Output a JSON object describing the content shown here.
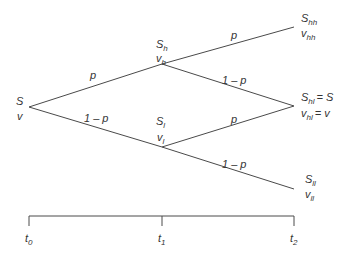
{
  "diagram": {
    "type": "binomial-tree",
    "nodes": [
      {
        "id": "root",
        "price": "S",
        "value": "v"
      },
      {
        "id": "h",
        "price_base": "S",
        "price_sub": "h",
        "value_base": "v",
        "value_sub": "h"
      },
      {
        "id": "l",
        "price_base": "S",
        "price_sub": "l",
        "value_base": "v",
        "value_sub": "l"
      },
      {
        "id": "hh",
        "price_base": "S",
        "price_sub": "hh",
        "value_base": "v",
        "value_sub": "hh"
      },
      {
        "id": "hl",
        "price_base": "S",
        "price_sub": "hl",
        "price_eq": "= S",
        "value_base": "v",
        "value_sub": "hl",
        "value_eq": "= v"
      },
      {
        "id": "ll",
        "price_base": "S",
        "price_sub": "ll",
        "value_base": "v",
        "value_sub": "ll"
      }
    ],
    "edges": {
      "root_h": "p",
      "root_l": "1 – p",
      "h_hh": "p",
      "h_hl": "1 – p",
      "l_hl": "p",
      "l_ll": "1 – p"
    },
    "timeline": {
      "ticks": [
        {
          "base": "t",
          "sub": "0"
        },
        {
          "base": "t",
          "sub": "1"
        },
        {
          "base": "t",
          "sub": "2"
        }
      ]
    }
  }
}
